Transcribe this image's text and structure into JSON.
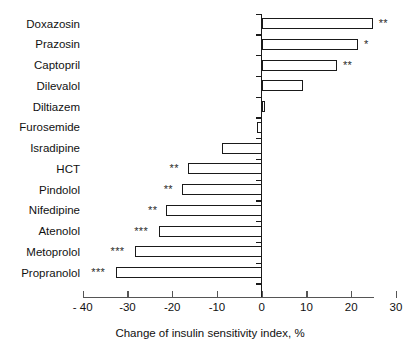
{
  "chart_data": {
    "type": "bar",
    "orientation": "horizontal",
    "title": "",
    "xlabel": "Change of insulin sensitivity index, %",
    "ylabel": "",
    "xlim": [
      -40,
      30
    ],
    "xticks": [
      -40,
      -30,
      -20,
      -10,
      0,
      10,
      20,
      30
    ],
    "xtick_labels": [
      "- 40",
      "-30",
      "-20",
      "-10",
      "0",
      "10",
      "20",
      "30"
    ],
    "grid": false,
    "legend": null,
    "categories": [
      "Doxazosin",
      "Prazosin",
      "Captopril",
      "Dilevalol",
      "Diltiazem",
      "Furosemide",
      "Isradipine",
      "HCT",
      "Pindolol",
      "Nifedipine",
      "Atenolol",
      "Metoprolol",
      "Propranolol"
    ],
    "values": [
      24.8,
      21.5,
      16.8,
      9.2,
      0.8,
      -1.0,
      -8.8,
      -16.5,
      -17.8,
      -21.3,
      -23.0,
      -28.3,
      -32.6
    ],
    "annotations": [
      "**",
      "*",
      "**",
      "",
      "",
      "",
      "",
      "**",
      "**",
      "**",
      "***",
      "***",
      "***"
    ],
    "bar_facecolor": "#ffffff",
    "bar_edgecolor": "#1a1a1a",
    "axis_color": "#1a1a1a"
  },
  "rows": [
    {
      "label": "Doxazosin",
      "value": 24.8,
      "sig": "**"
    },
    {
      "label": "Prazosin",
      "value": 21.5,
      "sig": "*"
    },
    {
      "label": "Captopril",
      "value": 16.8,
      "sig": "**"
    },
    {
      "label": "Dilevalol",
      "value": 9.2,
      "sig": ""
    },
    {
      "label": "Diltiazem",
      "value": 0.8,
      "sig": ""
    },
    {
      "label": "Furosemide",
      "value": -1.0,
      "sig": ""
    },
    {
      "label": "Isradipine",
      "value": -8.8,
      "sig": ""
    },
    {
      "label": "HCT",
      "value": -16.5,
      "sig": "**"
    },
    {
      "label": "Pindolol",
      "value": -17.8,
      "sig": "**"
    },
    {
      "label": "Nifedipine",
      "value": -21.3,
      "sig": "**"
    },
    {
      "label": "Atenolol",
      "value": -23.0,
      "sig": "***"
    },
    {
      "label": "Metoprolol",
      "value": -28.3,
      "sig": "***"
    },
    {
      "label": "Propranolol",
      "value": -32.6,
      "sig": "***"
    }
  ],
  "axis": {
    "title": "Change of insulin sensitivity index, %",
    "ticks": [
      {
        "value": -40,
        "label": "- 40"
      },
      {
        "value": -30,
        "label": "-30"
      },
      {
        "value": -20,
        "label": "-20"
      },
      {
        "value": -10,
        "label": "-10"
      },
      {
        "value": 0,
        "label": "0"
      },
      {
        "value": 10,
        "label": "10"
      },
      {
        "value": 20,
        "label": "20"
      },
      {
        "value": 30,
        "label": "30"
      }
    ]
  }
}
